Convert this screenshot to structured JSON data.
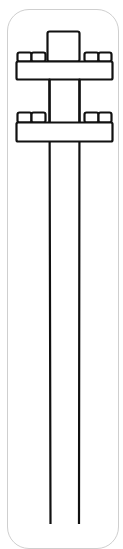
{
  "figure": {
    "stroke_color": "#111111",
    "frame_color": "#cfcfcf",
    "background": "#ffffff",
    "crossarm_count": 2
  }
}
